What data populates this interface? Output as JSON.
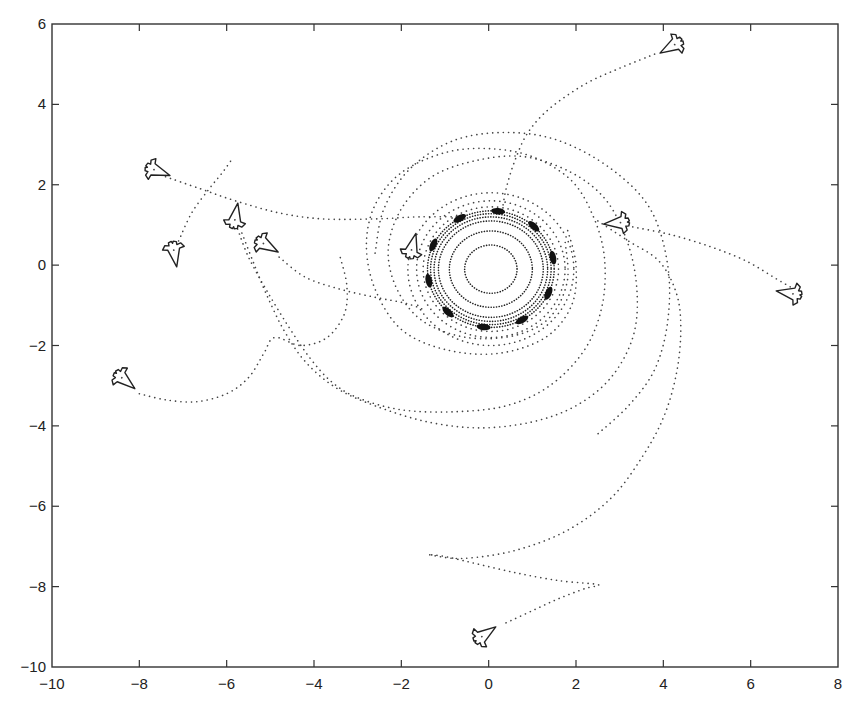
{
  "figure": {
    "width": 865,
    "height": 712,
    "plot_area_px": {
      "left": 52,
      "right": 838,
      "top": 24,
      "bottom": 667
    },
    "background": "#ffffff",
    "line_color": "#333333"
  },
  "chart_data": {
    "type": "scatter",
    "title": "",
    "xlabel": "",
    "ylabel": "",
    "xlim": [
      -10,
      8
    ],
    "ylim": [
      -10,
      6
    ],
    "grid": false,
    "legend": null,
    "x_ticks": [
      -10,
      -8,
      -6,
      -4,
      -2,
      0,
      2,
      4,
      6,
      8
    ],
    "y_ticks": [
      6,
      4,
      2,
      0,
      -2,
      -4,
      -6,
      -8,
      -10
    ],
    "x_tick_labels": [
      "-10",
      "-8",
      "-6",
      "-4",
      "-2",
      "0",
      "2",
      "4",
      "6",
      "8"
    ],
    "y_tick_labels": [
      "6",
      "4",
      "2",
      "0",
      "-2",
      "-4",
      "-6",
      "-8",
      "-10"
    ],
    "target_circle": {
      "center": [
        0.05,
        -0.1
      ],
      "radius": 1.45,
      "dense_clusters": 10
    },
    "agents": [
      {
        "id": 1,
        "position": [
          -7.6,
          2.35
        ],
        "heading_deg": -20
      },
      {
        "id": 2,
        "position": [
          -7.2,
          0.3
        ],
        "heading_deg": -80
      },
      {
        "id": 3,
        "position": [
          -5.8,
          1.2
        ],
        "heading_deg": 80
      },
      {
        "id": 4,
        "position": [
          -5.1,
          0.5
        ],
        "heading_deg": -30
      },
      {
        "id": 5,
        "position": [
          -8.35,
          -2.85
        ],
        "heading_deg": -40
      },
      {
        "id": 6,
        "position": [
          -1.75,
          0.45
        ],
        "heading_deg": 75
      },
      {
        "id": 7,
        "position": [
          2.95,
          1.05
        ],
        "heading_deg": 185
      },
      {
        "id": 8,
        "position": [
          6.9,
          -0.7
        ],
        "heading_deg": 170
      },
      {
        "id": 9,
        "position": [
          4.2,
          5.45
        ],
        "heading_deg": 210
      },
      {
        "id": 10,
        "position": [
          -0.1,
          -9.2
        ],
        "heading_deg": 35
      }
    ],
    "trajectories": [
      {
        "name": "traj-1",
        "points": [
          [
            -7.4,
            2.2
          ],
          [
            -6.6,
            1.9
          ],
          [
            -5.8,
            1.6
          ],
          [
            -4.8,
            1.3
          ],
          [
            -3.8,
            1.15
          ],
          [
            -2.6,
            1.15
          ],
          [
            -1.6,
            1.2
          ],
          [
            -0.6,
            1.2
          ]
        ]
      },
      {
        "name": "traj-2",
        "points": [
          [
            -7.1,
            0.6
          ],
          [
            -6.8,
            1.3
          ],
          [
            -6.4,
            1.9
          ],
          [
            -6.1,
            2.3
          ],
          [
            -5.9,
            2.6
          ]
        ]
      },
      {
        "name": "traj-3",
        "points": [
          [
            -5.75,
            0.9
          ],
          [
            -5.5,
            0.2
          ],
          [
            -5.1,
            -0.6
          ],
          [
            -4.6,
            -1.5
          ],
          [
            -4.1,
            -2.3
          ],
          [
            -3.6,
            -2.9
          ],
          [
            -3.0,
            -3.3
          ],
          [
            -2.0,
            -3.6
          ],
          [
            -0.8,
            -3.65
          ],
          [
            0.4,
            -3.5
          ],
          [
            1.4,
            -3.0
          ],
          [
            2.2,
            -2.1
          ],
          [
            2.6,
            -1.0
          ],
          [
            2.65,
            0.2
          ],
          [
            2.4,
            1.2
          ],
          [
            1.9,
            2.1
          ],
          [
            1.0,
            2.7
          ],
          [
            0.0,
            2.9
          ],
          [
            -1.0,
            2.8
          ],
          [
            -2.0,
            2.3
          ],
          [
            -2.6,
            1.5
          ],
          [
            -2.8,
            0.5
          ],
          [
            -2.6,
            -0.6
          ],
          [
            -2.0,
            -1.6
          ],
          [
            -1.0,
            -2.1
          ],
          [
            0.2,
            -2.2
          ],
          [
            1.3,
            -1.8
          ],
          [
            1.9,
            -1.0
          ],
          [
            2.0,
            0.0
          ],
          [
            1.8,
            0.9
          ]
        ]
      },
      {
        "name": "traj-4",
        "points": [
          [
            -4.8,
            0.2
          ],
          [
            -4.2,
            -0.3
          ],
          [
            -3.4,
            -0.6
          ],
          [
            -2.6,
            -0.8
          ],
          [
            -1.9,
            -0.95
          ],
          [
            -1.5,
            -1.1
          ]
        ]
      },
      {
        "name": "traj-5",
        "points": [
          [
            -8.0,
            -3.2
          ],
          [
            -7.4,
            -3.35
          ],
          [
            -6.7,
            -3.4
          ],
          [
            -6.0,
            -3.2
          ],
          [
            -5.5,
            -2.8
          ],
          [
            -5.15,
            -2.2
          ],
          [
            -4.9,
            -1.8
          ],
          [
            -4.3,
            -2.0
          ],
          [
            -3.7,
            -1.8
          ],
          [
            -3.3,
            -1.2
          ],
          [
            -3.25,
            -0.5
          ],
          [
            -3.4,
            0.2
          ]
        ]
      },
      {
        "name": "traj-6",
        "points": [
          [
            -5.65,
            0.8
          ],
          [
            -5.4,
            0.1
          ],
          [
            -5.1,
            -0.7
          ],
          [
            -4.7,
            -1.6
          ],
          [
            -4.2,
            -2.4
          ],
          [
            -3.5,
            -3.05
          ],
          [
            -2.6,
            -3.5
          ],
          [
            -1.4,
            -3.9
          ],
          [
            -0.2,
            -4.05
          ],
          [
            1.0,
            -3.9
          ],
          [
            2.0,
            -3.5
          ],
          [
            2.8,
            -2.8
          ],
          [
            3.3,
            -1.8
          ],
          [
            3.4,
            -0.7
          ],
          [
            3.2,
            0.5
          ],
          [
            2.7,
            1.6
          ],
          [
            1.9,
            2.3
          ],
          [
            0.8,
            2.7
          ],
          [
            -0.3,
            2.6
          ],
          [
            -1.3,
            2.2
          ],
          [
            -2.0,
            1.4
          ],
          [
            -2.3,
            0.4
          ],
          [
            -2.1,
            -0.6
          ],
          [
            -1.5,
            -1.4
          ],
          [
            -0.5,
            -1.8
          ],
          [
            0.6,
            -1.75
          ],
          [
            1.4,
            -1.3
          ],
          [
            1.8,
            -0.4
          ],
          [
            1.75,
            0.6
          ]
        ]
      },
      {
        "name": "traj-7",
        "points": [
          [
            3.3,
            0.95
          ],
          [
            4.2,
            0.75
          ],
          [
            5.1,
            0.45
          ],
          [
            5.9,
            0.1
          ],
          [
            6.6,
            -0.35
          ],
          [
            7.0,
            -0.6
          ]
        ]
      },
      {
        "name": "traj-8",
        "points": [
          [
            2.5,
            1.1
          ],
          [
            3.2,
            0.6
          ],
          [
            3.9,
            0.1
          ],
          [
            4.3,
            -0.7
          ],
          [
            4.4,
            -1.6
          ],
          [
            4.3,
            -2.7
          ],
          [
            4.0,
            -3.8
          ],
          [
            3.5,
            -4.8
          ],
          [
            2.8,
            -5.8
          ],
          [
            1.8,
            -6.6
          ],
          [
            0.6,
            -7.1
          ],
          [
            -0.6,
            -7.3
          ],
          [
            -1.4,
            -7.2
          ]
        ]
      },
      {
        "name": "traj-9",
        "points": [
          [
            3.8,
            5.25
          ],
          [
            3.0,
            4.9
          ],
          [
            2.2,
            4.5
          ],
          [
            1.4,
            3.9
          ],
          [
            0.9,
            3.3
          ],
          [
            0.6,
            2.6
          ],
          [
            0.4,
            1.9
          ],
          [
            0.3,
            1.3
          ]
        ]
      },
      {
        "name": "traj-10",
        "points": [
          [
            0.4,
            -8.9
          ],
          [
            1.0,
            -8.6
          ],
          [
            1.6,
            -8.3
          ],
          [
            2.2,
            -8.05
          ],
          [
            2.5,
            -7.95
          ],
          [
            1.6,
            -7.85
          ],
          [
            0.6,
            -7.65
          ],
          [
            -0.4,
            -7.4
          ],
          [
            -1.0,
            -7.25
          ],
          [
            -1.4,
            -7.2
          ]
        ]
      },
      {
        "name": "traj-outer-arc",
        "points": [
          [
            -2.6,
            0.3
          ],
          [
            -2.4,
            1.4
          ],
          [
            -1.8,
            2.4
          ],
          [
            -0.8,
            3.1
          ],
          [
            0.4,
            3.3
          ],
          [
            1.6,
            3.1
          ],
          [
            2.8,
            2.4
          ],
          [
            3.7,
            1.4
          ],
          [
            4.1,
            0.0
          ],
          [
            4.1,
            -1.4
          ],
          [
            3.8,
            -2.6
          ],
          [
            3.2,
            -3.5
          ],
          [
            2.5,
            -4.2
          ]
        ]
      }
    ]
  }
}
